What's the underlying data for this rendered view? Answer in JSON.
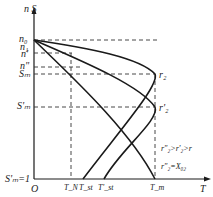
{
  "diagram": {
    "type": "torque-speed characteristic (motor, varying rotor resistance)",
    "axes": {
      "x_label": "T",
      "y_label": "n S",
      "origin": "O"
    },
    "y_ticks": [
      {
        "label": "n₀",
        "y": 40
      },
      {
        "label": "n₁",
        "y": 46
      },
      {
        "label": "n'",
        "y": 53
      },
      {
        "label": "n\"",
        "y": 67
      },
      {
        "label": "Sₘ",
        "y": 74
      },
      {
        "label": "S'ₘ",
        "y": 107
      },
      {
        "label": "S'ₘ=1",
        "y": 179
      }
    ],
    "x_ticks": [
      {
        "label": "T_N",
        "x": 71
      },
      {
        "label": "T_st",
        "x": 83
      },
      {
        "label": "T'_st",
        "x": 104
      },
      {
        "label": "T_m",
        "x": 155
      }
    ],
    "curve_labels": [
      {
        "label": "r₂",
        "x": 158,
        "y": 70
      },
      {
        "label": "r'₂",
        "x": 158,
        "y": 103
      }
    ],
    "annotations": [
      "r\"₂>r'₂>r",
      "r\"₂=X₀₂"
    ],
    "colors": {
      "line": "#1a1a1a",
      "dash": "#333333",
      "text": "#222222"
    }
  }
}
